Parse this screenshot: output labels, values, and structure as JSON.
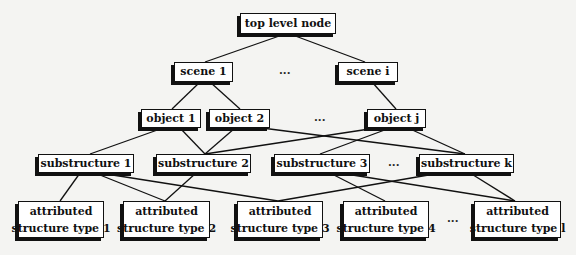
{
  "diagram": {
    "type": "hierarchy",
    "levels": {
      "root": [
        {
          "id": "root",
          "label": "top level node"
        }
      ],
      "scenes": [
        {
          "id": "s1",
          "label": "scene 1"
        },
        {
          "id": "si",
          "label": "scene i"
        }
      ],
      "objects": [
        {
          "id": "o1",
          "label": "object 1"
        },
        {
          "id": "o2",
          "label": "object 2"
        },
        {
          "id": "oj",
          "label": "object j"
        }
      ],
      "substructures": [
        {
          "id": "u1",
          "label": "substructure 1"
        },
        {
          "id": "u2",
          "label": "substructure 2"
        },
        {
          "id": "u3",
          "label": "substructure 3"
        },
        {
          "id": "uk",
          "label": "substructure k"
        }
      ],
      "leaves": [
        {
          "id": "t1",
          "line1": "attributed",
          "line2": "structure type 1"
        },
        {
          "id": "t2",
          "line1": "attributed",
          "line2": "structure type 2"
        },
        {
          "id": "t3",
          "line1": "attributed",
          "line2": "structure type 3"
        },
        {
          "id": "t4",
          "line1": "attributed",
          "line2": "structure type 4"
        },
        {
          "id": "tl",
          "line1": "attributed",
          "line2": "structure type l"
        }
      ]
    },
    "ellipsis": "...",
    "edges": [
      [
        "root",
        "s1"
      ],
      [
        "root",
        "si"
      ],
      [
        "s1",
        "o1"
      ],
      [
        "s1",
        "o2"
      ],
      [
        "si",
        "oj"
      ],
      [
        "o1",
        "u1"
      ],
      [
        "o1",
        "u2"
      ],
      [
        "o2",
        "u2"
      ],
      [
        "o2",
        "uk"
      ],
      [
        "oj",
        "u2"
      ],
      [
        "oj",
        "u3"
      ],
      [
        "oj",
        "uk"
      ],
      [
        "u1",
        "t1"
      ],
      [
        "u1",
        "t2"
      ],
      [
        "u1",
        "t3"
      ],
      [
        "u2",
        "t2"
      ],
      [
        "u3",
        "t4"
      ],
      [
        "u3",
        "tl"
      ],
      [
        "uk",
        "t3"
      ],
      [
        "uk",
        "tl"
      ]
    ]
  }
}
